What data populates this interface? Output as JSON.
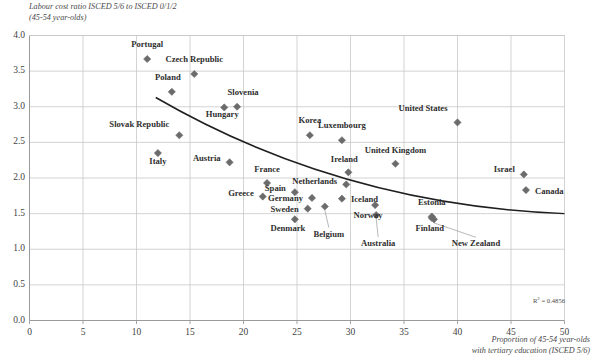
{
  "chart_data": {
    "type": "scatter",
    "title": "",
    "ylabel": "Labour cost ratio ISCED 5/6 to ISCED 0/1/2 (45-54 year-olds)",
    "ylabel_line1": "Labour cost ratio ISCED 5/6 to ISCED 0/1/2",
    "ylabel_line2": "(45-54 year-olds)",
    "xlabel": "Proportion of 45-54 year-olds with tertiary education (ISCED 5/6)",
    "xlabel_line1": "Proportion of 45-54 year-olds",
    "xlabel_line2": "with tertiary education (ISCED 5/6)",
    "xlim": [
      0,
      50
    ],
    "ylim": [
      0.0,
      4.0
    ],
    "xticks": [
      0,
      5,
      10,
      15,
      20,
      25,
      30,
      35,
      40,
      45,
      50
    ],
    "ytick_labels": [
      "0.0",
      "0.5",
      "1.0",
      "1.5",
      "2.0",
      "2.5",
      "3.0",
      "3.5",
      "4.0"
    ],
    "yticks": [
      0.0,
      0.5,
      1.0,
      1.5,
      2.0,
      2.5,
      3.0,
      3.5,
      4.0
    ],
    "grid": true,
    "legend": "none",
    "annotation_r2_prefix": "R",
    "annotation_r2_sup": "2",
    "annotation_r2_value": " = 0.4856",
    "annotation_r2": "R² = 0.4856",
    "marker_color": "#6b6b6b",
    "trendline_color": "#1f1f1f",
    "grid_color": "#c8c8c8",
    "axis_color": "#9a9a9a",
    "trendline": {
      "x_start": 11.8,
      "y_start": 3.13,
      "x_mid": 30.0,
      "y_mid": 1.97,
      "x_end": 50.0,
      "y_end": 1.5
    },
    "points": [
      {
        "name": "Portugal",
        "x": 11.0,
        "y": 3.67,
        "label_dx": 0,
        "label_dy": -13,
        "align": "center"
      },
      {
        "name": "Czech Republic",
        "x": 15.4,
        "y": 3.46,
        "label_dx": 0,
        "label_dy": -13,
        "align": "center"
      },
      {
        "name": "Poland",
        "x": 13.3,
        "y": 3.21,
        "label_dx": -4,
        "label_dy": -13,
        "align": "center"
      },
      {
        "name": "Slovenia",
        "x": 19.4,
        "y": 3.0,
        "label_dx": 6,
        "label_dy": -13,
        "align": "center"
      },
      {
        "name": "Hungary",
        "x": 18.2,
        "y": 2.99,
        "label_dx": -2,
        "label_dy": 9,
        "align": "center"
      },
      {
        "name": "Slovak Republic",
        "x": 14.0,
        "y": 2.6,
        "label_dx": -10,
        "label_dy": -9,
        "align": "right"
      },
      {
        "name": "Korea",
        "x": 26.2,
        "y": 2.6,
        "label_dx": 0,
        "label_dy": -13,
        "align": "center"
      },
      {
        "name": "Luxembourg",
        "x": 29.2,
        "y": 2.53,
        "label_dx": 0,
        "label_dy": -13,
        "align": "center"
      },
      {
        "name": "United States",
        "x": 40.0,
        "y": 2.78,
        "label_dx": -10,
        "label_dy": -12,
        "align": "right"
      },
      {
        "name": "Italy",
        "x": 12.0,
        "y": 2.35,
        "label_dx": 0,
        "label_dy": 10,
        "align": "center"
      },
      {
        "name": "Austria",
        "x": 18.7,
        "y": 2.22,
        "label_dx": -9,
        "label_dy": -2,
        "align": "right"
      },
      {
        "name": "United Kingdom",
        "x": 34.2,
        "y": 2.2,
        "label_dx": 0,
        "label_dy": -12,
        "align": "center"
      },
      {
        "name": "Israel",
        "x": 46.2,
        "y": 2.05,
        "label_dx": -9,
        "label_dy": -3,
        "align": "right"
      },
      {
        "name": "Ireland",
        "x": 29.8,
        "y": 2.08,
        "label_dx": -4,
        "label_dy": -11,
        "align": "center"
      },
      {
        "name": "France",
        "x": 22.2,
        "y": 1.93,
        "label_dx": 0,
        "label_dy": -12,
        "align": "center"
      },
      {
        "name": "Canada",
        "x": 46.4,
        "y": 1.83,
        "label_dx": 9,
        "label_dy": 3,
        "align": "left"
      },
      {
        "name": "Greece",
        "x": 21.8,
        "y": 1.74,
        "label_dx": -9,
        "label_dy": -2,
        "align": "right"
      },
      {
        "name": "Spain",
        "x": 24.8,
        "y": 1.8,
        "label_dx": -9,
        "label_dy": -2,
        "align": "right"
      },
      {
        "name": "Netherlands",
        "x": 29.6,
        "y": 1.91,
        "label_dx": -9,
        "label_dy": -1,
        "align": "right"
      },
      {
        "name": "Germany",
        "x": 26.4,
        "y": 1.72,
        "label_dx": -9,
        "label_dy": 2,
        "align": "right"
      },
      {
        "name": "Iceland",
        "x": 29.2,
        "y": 1.71,
        "label_dx": 9,
        "label_dy": 2,
        "align": "left"
      },
      {
        "name": "Sweden",
        "x": 26.0,
        "y": 1.57,
        "label_dx": -9,
        "label_dy": 2,
        "align": "right"
      },
      {
        "name": "Estonia",
        "x": 37.6,
        "y": 1.46,
        "label_dx": 0,
        "label_dy": -12,
        "align": "center"
      },
      {
        "name": "Denmark",
        "x": 24.8,
        "y": 1.42,
        "label_dx": -7,
        "label_dy": 11,
        "align": "center"
      },
      {
        "name": "Belgium",
        "x": 27.6,
        "y": 1.6,
        "label_dx": 4,
        "label_dy": 29,
        "align": "center",
        "leader": true
      },
      {
        "name": "Norway",
        "x": 32.3,
        "y": 1.62,
        "label_dx": -7,
        "label_dy": 12,
        "align": "center"
      },
      {
        "name": "Australia",
        "x": 32.4,
        "y": 1.48,
        "label_dx": 2,
        "label_dy": 30,
        "align": "center",
        "leader": true
      },
      {
        "name": "Finland",
        "x": 37.6,
        "y": 1.44,
        "label_dx": -2,
        "label_dy": 12,
        "align": "center"
      },
      {
        "name": "New Zealand",
        "x": 37.8,
        "y": 1.42,
        "label_dx": 42,
        "label_dy": 26,
        "align": "center",
        "leader": true
      }
    ]
  }
}
